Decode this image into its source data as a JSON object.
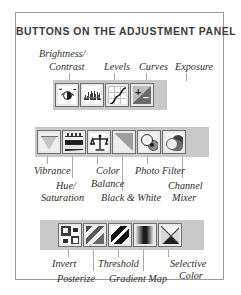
{
  "figure": {
    "title": "BUTTONS ON THE ADJUSTMENT PANEL",
    "border_color": "#9b9b9b",
    "background": "#ffffff",
    "strip_background": "#c9c9c9",
    "label_color": "#2e2e2e"
  },
  "groups": [
    {
      "name": "tonal-adjustments",
      "labels": [
        {
          "key": "brightness_contrast",
          "line1": "Brightness/",
          "line2": "Contrast"
        },
        {
          "key": "levels",
          "line1": "Levels",
          "line2": ""
        },
        {
          "key": "curves",
          "line1": "Curves",
          "line2": ""
        },
        {
          "key": "exposure",
          "line1": "Exposure",
          "line2": ""
        }
      ],
      "buttons": [
        {
          "key": "brightness-contrast",
          "icon": "sun-icon"
        },
        {
          "key": "levels",
          "icon": "histogram-icon"
        },
        {
          "key": "curves",
          "icon": "curve-icon"
        },
        {
          "key": "exposure",
          "icon": "exposure-wedge-icon"
        }
      ]
    },
    {
      "name": "color-adjustments",
      "labels": [
        {
          "key": "vibrance",
          "line1": "Vibrance",
          "line2": ""
        },
        {
          "key": "hue_saturation",
          "line1": "Hue/",
          "line2": "Saturation"
        },
        {
          "key": "color_balance",
          "line1": "Color",
          "line2": "Balance"
        },
        {
          "key": "black_and_white",
          "line1": "Black & White",
          "line2": ""
        },
        {
          "key": "photo_filter",
          "line1": "Photo Filter",
          "line2": ""
        },
        {
          "key": "channel_mixer",
          "line1": "Channel",
          "line2": "Mixer"
        }
      ],
      "buttons": [
        {
          "key": "vibrance",
          "icon": "triangle-icon"
        },
        {
          "key": "hue-saturation",
          "icon": "color-bars-icon"
        },
        {
          "key": "color-balance",
          "icon": "scales-icon"
        },
        {
          "key": "black-and-white",
          "icon": "gray-wedge-icon"
        },
        {
          "key": "photo-filter",
          "icon": "lens-circles-icon"
        },
        {
          "key": "channel-mixer",
          "icon": "overlapping-circles-icon"
        }
      ]
    },
    {
      "name": "special-adjustments",
      "labels": [
        {
          "key": "invert",
          "line1": "Invert",
          "line2": ""
        },
        {
          "key": "posterize",
          "line1": "Posterize",
          "line2": ""
        },
        {
          "key": "threshold",
          "line1": "Threshold",
          "line2": ""
        },
        {
          "key": "gradient_map",
          "line1": "Gradient Map",
          "line2": ""
        },
        {
          "key": "selective_color",
          "line1": "Selective",
          "line2": "Color"
        }
      ],
      "buttons": [
        {
          "key": "invert",
          "icon": "inverted-squares-icon"
        },
        {
          "key": "posterize",
          "icon": "posterize-bands-icon"
        },
        {
          "key": "threshold",
          "icon": "threshold-stripes-icon"
        },
        {
          "key": "gradient-map",
          "icon": "gradient-icon"
        },
        {
          "key": "selective-color",
          "icon": "x-cross-icon"
        }
      ]
    }
  ]
}
